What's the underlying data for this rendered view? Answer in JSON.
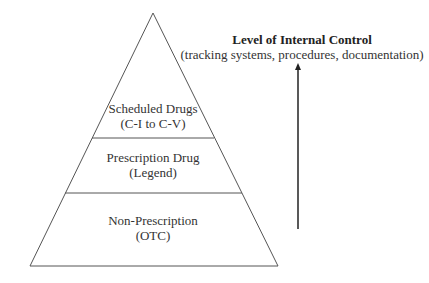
{
  "diagram": {
    "tiers": [
      {
        "line1": "Scheduled Drugs",
        "line2": "(C-I to C-V)"
      },
      {
        "line1": "Prescription Drug",
        "line2": "(Legend)"
      },
      {
        "line1": "Non-Prescription",
        "line2": "(OTC)"
      }
    ],
    "arrow": {
      "title": "Level of Internal Control",
      "subtitle": "(tracking systems, procedures, documentation)"
    },
    "colors": {
      "line": "#555555",
      "text": "#333333"
    }
  }
}
